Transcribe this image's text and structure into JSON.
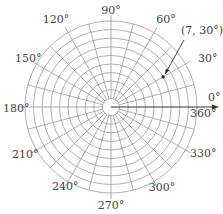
{
  "diagram": {
    "type": "polar-grid",
    "center": {
      "x": 111,
      "y": 107
    },
    "outer_radius": 86,
    "circle_count": 10,
    "ray_step_deg": 15,
    "colors": {
      "grid": "#9a9a9a",
      "axis": "#333333",
      "label": "#444444",
      "arrow": "#333333",
      "point": "#222222"
    },
    "angle_labels": [
      {
        "deg": 0,
        "text": "0°"
      },
      {
        "deg": 30,
        "text": "30°"
      },
      {
        "deg": 60,
        "text": "60°"
      },
      {
        "deg": 90,
        "text": "90°"
      },
      {
        "deg": 120,
        "text": "120°"
      },
      {
        "deg": 150,
        "text": "150°"
      },
      {
        "deg": 180,
        "text": "180°"
      },
      {
        "deg": 210,
        "text": "210°"
      },
      {
        "deg": 240,
        "text": "240°"
      },
      {
        "deg": 270,
        "text": "270°"
      },
      {
        "deg": 300,
        "text": "300°"
      },
      {
        "deg": 330,
        "text": "330°"
      },
      {
        "deg": 360,
        "text": "360°"
      }
    ],
    "point": {
      "r": 7,
      "theta_deg": 30,
      "label": "(7, 30°)"
    }
  }
}
